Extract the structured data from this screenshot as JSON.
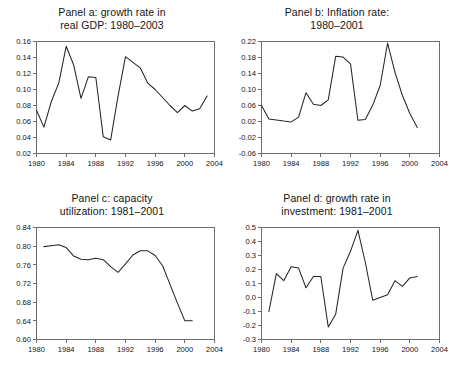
{
  "figure": {
    "name": "four-panel-macroeconomic-time-series",
    "background": "#ffffff",
    "line_color": "#262626",
    "axis_color": "#6e6e6e"
  },
  "chart_data": [
    {
      "type": "line",
      "panel": "a",
      "title": "Panel a: growth rate in\nreal GDP: 1980–2003",
      "title_line1": "Panel a: growth rate in",
      "title_line2": "real GDP: 1980–2003",
      "xlabel": "",
      "ylabel": "",
      "xlim": [
        1980,
        2004
      ],
      "ylim": [
        0.02,
        0.16
      ],
      "xticks": [
        1980,
        1984,
        1988,
        1992,
        1996,
        2000,
        2004
      ],
      "xticklabels": [
        "1980",
        "1984",
        "1988",
        "1992",
        "1996",
        "2000",
        "2004"
      ],
      "yticks": [
        0.02,
        0.04,
        0.06,
        0.08,
        0.1,
        0.12,
        0.14,
        0.16
      ],
      "yticklabels": [
        "0.02",
        "0.04",
        "0.06",
        "0.08",
        "0.10",
        "0.12",
        "0.14",
        "0.16"
      ],
      "grid": false,
      "legend": "none",
      "x": [
        1980,
        1981,
        1982,
        1983,
        1984,
        1985,
        1986,
        1987,
        1988,
        1989,
        1990,
        1991,
        1992,
        1993,
        1994,
        1995,
        1996,
        1997,
        1998,
        1999,
        2000,
        2001,
        2002,
        2003
      ],
      "values": [
        0.074,
        0.053,
        0.085,
        0.108,
        0.154,
        0.131,
        0.089,
        0.116,
        0.115,
        0.041,
        0.037,
        0.092,
        0.141,
        0.134,
        0.127,
        0.108,
        0.1,
        0.09,
        0.08,
        0.071,
        0.08,
        0.073,
        0.076,
        0.092
      ]
    },
    {
      "type": "line",
      "panel": "b",
      "title": "Panel b: Inflation rate:\n1980–2001",
      "title_line1": "Panel b: Inflation rate:",
      "title_line2": "1980–2001",
      "xlabel": "",
      "ylabel": "",
      "xlim": [
        1980,
        2004
      ],
      "ylim": [
        -0.06,
        0.22
      ],
      "xticks": [
        1980,
        1984,
        1988,
        1992,
        1996,
        2000,
        2004
      ],
      "xticklabels": [
        "1980",
        "1984",
        "1988",
        "1992",
        "1996",
        "2000",
        "2004"
      ],
      "yticks": [
        -0.06,
        -0.02,
        0.02,
        0.06,
        0.1,
        0.14,
        0.18,
        0.22
      ],
      "yticklabels": [
        "-0.06",
        "-0.02",
        "0.02",
        "0.06",
        "0.10",
        "0.14",
        "0.18",
        "0.22"
      ],
      "grid": false,
      "legend": "none",
      "x": [
        1980,
        1981,
        1982,
        1983,
        1984,
        1985,
        1986,
        1987,
        1988,
        1989,
        1990,
        1991,
        1992,
        1993,
        1994,
        1995,
        1996,
        1997,
        1998,
        1999,
        2000,
        2001
      ],
      "values": [
        0.06,
        0.026,
        0.024,
        0.021,
        0.019,
        0.031,
        0.092,
        0.063,
        0.06,
        0.074,
        0.183,
        0.181,
        0.164,
        0.023,
        0.025,
        0.061,
        0.11,
        0.216,
        0.143,
        0.085,
        0.04,
        0.005
      ]
    },
    {
      "type": "line",
      "panel": "c",
      "title": "Panel c: capacity\nutilization: 1981–2001",
      "title_line1": "Panel c: capacity",
      "title_line2": "utilization: 1981–2001",
      "xlabel": "",
      "ylabel": "",
      "xlim": [
        1980,
        2004
      ],
      "ylim": [
        0.6,
        0.84
      ],
      "xticks": [
        1980,
        1984,
        1988,
        1992,
        1996,
        2000,
        2004
      ],
      "xticklabels": [
        "1980",
        "1984",
        "1988",
        "1992",
        "1996",
        "2000",
        "2004"
      ],
      "yticks": [
        0.6,
        0.64,
        0.68,
        0.72,
        0.76,
        0.8,
        0.84
      ],
      "yticklabels": [
        "0.60",
        "0.64",
        "0.68",
        "0.72",
        "0.76",
        "0.80",
        "0.84"
      ],
      "grid": false,
      "legend": "none",
      "x": [
        1981,
        1982,
        1983,
        1984,
        1985,
        1986,
        1987,
        1988,
        1989,
        1990,
        1991,
        1992,
        1993,
        1994,
        1995,
        1996,
        1997,
        1998,
        1999,
        2000,
        2001
      ],
      "values": [
        0.799,
        0.801,
        0.803,
        0.797,
        0.779,
        0.772,
        0.771,
        0.774,
        0.771,
        0.756,
        0.744,
        0.762,
        0.781,
        0.79,
        0.79,
        0.78,
        0.758,
        0.718,
        0.678,
        0.64,
        0.64
      ]
    },
    {
      "type": "line",
      "panel": "d",
      "title": "Panel d: growth rate in\ninvestment: 1981–2001",
      "title_line1": "Panel d: growth rate in",
      "title_line2": "investment: 1981–2001",
      "xlabel": "",
      "ylabel": "",
      "xlim": [
        1980,
        2004
      ],
      "ylim": [
        -0.3,
        0.5
      ],
      "xticks": [
        1980,
        1984,
        1988,
        1992,
        1996,
        2000,
        2004
      ],
      "xticklabels": [
        "1980",
        "1984",
        "1988",
        "1992",
        "1996",
        "2000",
        "2004"
      ],
      "yticks": [
        -0.3,
        -0.2,
        -0.1,
        0.0,
        0.1,
        0.2,
        0.3,
        0.4,
        0.5
      ],
      "yticklabels": [
        "-0.3",
        "-0.2",
        "-0.1",
        "0.0",
        "0.1",
        "0.2",
        "0.3",
        "0.4",
        "0.5"
      ],
      "grid": false,
      "legend": "none",
      "x": [
        1981,
        1982,
        1983,
        1984,
        1985,
        1986,
        1987,
        1988,
        1989,
        1990,
        1991,
        1992,
        1993,
        1994,
        1995,
        1996,
        1997,
        1998,
        1999,
        2000,
        2001
      ],
      "values": [
        -0.1,
        0.17,
        0.12,
        0.22,
        0.21,
        0.07,
        0.15,
        0.15,
        -0.21,
        -0.12,
        0.21,
        0.33,
        0.48,
        0.25,
        -0.02,
        0.0,
        0.02,
        0.12,
        0.08,
        0.14,
        0.15
      ]
    }
  ]
}
